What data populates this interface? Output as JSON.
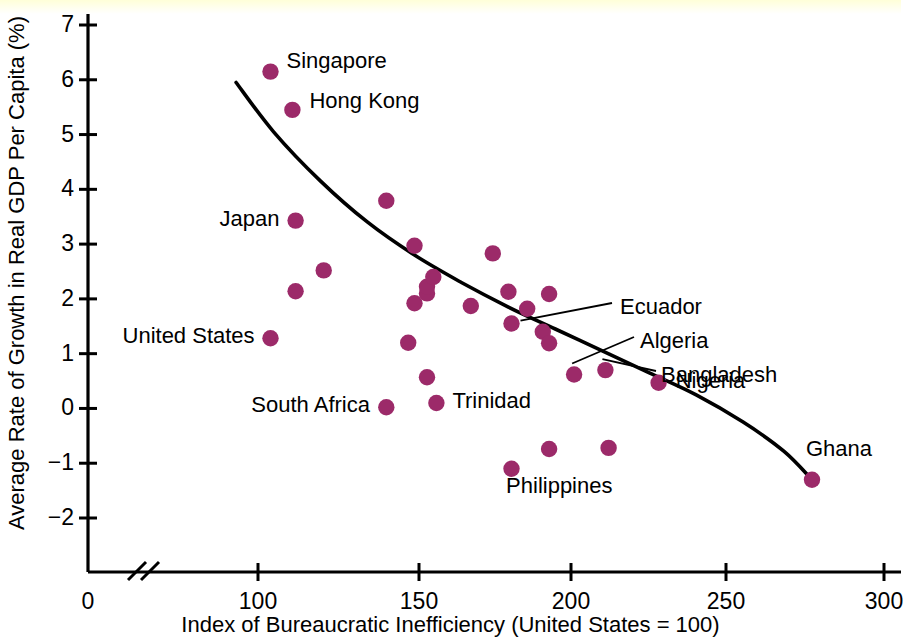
{
  "chart_data": {
    "type": "scatter",
    "title": "",
    "xlabel": "Index of Bureaucratic Inefficiency (United States = 100)",
    "ylabel": "Average Rate of Growth in Real GDP Per Capita (%)",
    "xlim": [
      85,
      305
    ],
    "ylim": [
      -2.6,
      7.35
    ],
    "x_ticks": [
      0,
      100,
      150,
      200,
      250,
      300
    ],
    "y_ticks": [
      -2,
      -1,
      0,
      1,
      2,
      3,
      4,
      5,
      6,
      7
    ],
    "x_axis_break": true,
    "grid": false,
    "legend": "none",
    "marker_color": "#9c2a69",
    "curve_color": "#000000",
    "points": [
      {
        "label": "Singapore",
        "x": 104,
        "y": 6.15,
        "label_pos": "right"
      },
      {
        "label": "Hong Kong",
        "x": 111,
        "y": 5.45,
        "label_pos": "right"
      },
      {
        "label": "Japan",
        "x": 112,
        "y": 3.43,
        "label_pos": "left"
      },
      {
        "label": "United States",
        "x": 104,
        "y": 1.28,
        "label_pos": "left"
      },
      {
        "label": "South Africa",
        "x": 141,
        "y": 0.02,
        "label_pos": "left"
      },
      {
        "label": "Trinidad",
        "x": 157,
        "y": 0.1,
        "label_pos": "right"
      },
      {
        "label": "Ecuador",
        "x": 181,
        "y": 1.55,
        "label_pos": "leader"
      },
      {
        "label": "Algeria",
        "x": 201,
        "y": 0.62,
        "label_pos": "leader"
      },
      {
        "label": "Bangladesh",
        "x": 211,
        "y": 0.7,
        "label_pos": "leader"
      },
      {
        "label": "Nigeria",
        "x": 228,
        "y": 0.47,
        "label_pos": "right"
      },
      {
        "label": "Philippines",
        "x": 193,
        "y": -0.74,
        "label_pos": "below"
      },
      {
        "label": "Ghana",
        "x": 277,
        "y": -1.3,
        "label_pos": "above-right"
      },
      {
        "label": "",
        "x": 112,
        "y": 2.14,
        "label_pos": "none"
      },
      {
        "label": "",
        "x": 121,
        "y": 2.52,
        "label_pos": "none"
      },
      {
        "label": "",
        "x": 141,
        "y": 3.79,
        "label_pos": "none"
      },
      {
        "label": "",
        "x": 148,
        "y": 1.2,
        "label_pos": "none"
      },
      {
        "label": "",
        "x": 150,
        "y": 2.97,
        "label_pos": "none"
      },
      {
        "label": "",
        "x": 150,
        "y": 1.92,
        "label_pos": "none"
      },
      {
        "label": "",
        "x": 154,
        "y": 2.1,
        "label_pos": "none"
      },
      {
        "label": "",
        "x": 154,
        "y": 2.22,
        "label_pos": "none"
      },
      {
        "label": "",
        "x": 156,
        "y": 2.4,
        "label_pos": "none"
      },
      {
        "label": "",
        "x": 154,
        "y": 0.57,
        "label_pos": "none"
      },
      {
        "label": "",
        "x": 168,
        "y": 1.87,
        "label_pos": "none"
      },
      {
        "label": "",
        "x": 175,
        "y": 2.83,
        "label_pos": "none"
      },
      {
        "label": "",
        "x": 180,
        "y": 2.13,
        "label_pos": "none"
      },
      {
        "label": "",
        "x": 186,
        "y": 1.82,
        "label_pos": "none"
      },
      {
        "label": "",
        "x": 193,
        "y": 2.09,
        "label_pos": "none"
      },
      {
        "label": "",
        "x": 191,
        "y": 1.4,
        "label_pos": "none"
      },
      {
        "label": "",
        "x": 193,
        "y": 1.19,
        "label_pos": "none"
      },
      {
        "label": "",
        "x": 181,
        "y": -1.1,
        "label_pos": "none"
      },
      {
        "label": "",
        "x": 212,
        "y": -0.72,
        "label_pos": "none"
      }
    ],
    "curve": [
      {
        "x": 93,
        "y": 5.95
      },
      {
        "x": 105,
        "y": 5.05
      },
      {
        "x": 120,
        "y": 4.15
      },
      {
        "x": 135,
        "y": 3.4
      },
      {
        "x": 150,
        "y": 2.8
      },
      {
        "x": 165,
        "y": 2.3
      },
      {
        "x": 180,
        "y": 1.85
      },
      {
        "x": 195,
        "y": 1.45
      },
      {
        "x": 210,
        "y": 1.05
      },
      {
        "x": 225,
        "y": 0.65
      },
      {
        "x": 240,
        "y": 0.25
      },
      {
        "x": 255,
        "y": -0.25
      },
      {
        "x": 268,
        "y": -0.78
      },
      {
        "x": 277,
        "y": -1.3
      }
    ]
  },
  "axes": {
    "y_tick_labels": [
      "7",
      "6",
      "5",
      "4",
      "3",
      "2",
      "1",
      "0",
      "−1",
      "−2"
    ],
    "x_tick_labels": [
      "0",
      "100",
      "150",
      "200",
      "250",
      "300"
    ]
  }
}
